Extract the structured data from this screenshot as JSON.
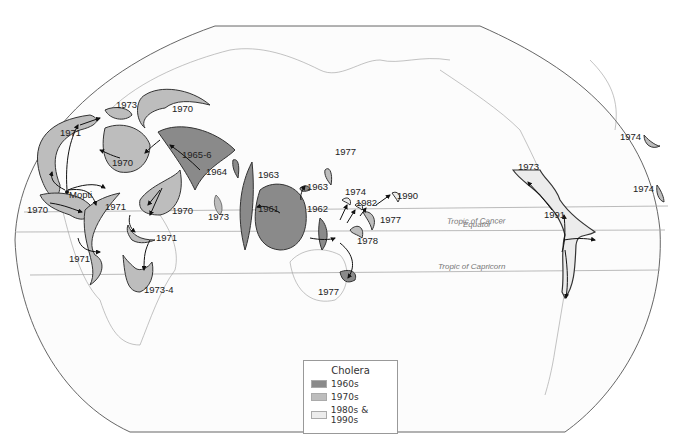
{
  "map": {
    "title": "Cholera",
    "lines": {
      "tropic_cancer": "Tropic of Cancer",
      "equator": "Equator",
      "tropic_capricorn": "Tropic of Capricorn"
    },
    "places": {
      "mopti": "Mopti"
    },
    "labels": {
      "w1973": "1973",
      "w1970a": "1970",
      "w1971a": "1971",
      "w1970b": "1970",
      "w1965": "1965-6",
      "w1964": "1964",
      "w1970c": "1970",
      "w1971b": "1971",
      "w1970d": "1970",
      "w1973b": "1973",
      "w1971c": "1971",
      "w1971d": "1971",
      "w1973_4": "1973-4",
      "e1963a": "1963",
      "e1961": "1961",
      "e1963b": "1963",
      "e1977a": "1977",
      "e1962": "1962",
      "e1974": "1974",
      "e1982": "1982",
      "e1990": "1990",
      "e1977b": "1977",
      "e1978": "1978",
      "e1977c": "1977",
      "a1973": "1973",
      "a1974a": "1974",
      "a1974b": "1974",
      "a1991": "1991"
    }
  },
  "legend": {
    "title": "Cholera",
    "items": [
      {
        "label": "1960s",
        "color": "#8a8a8a"
      },
      {
        "label": "1970s",
        "color": "#bdbdbd"
      },
      {
        "label": "1980s & 1990s",
        "color": "#ececec"
      }
    ]
  },
  "colors": {
    "c1960s": "#8a8a8a",
    "c1970s": "#bdbdbd",
    "c1980s": "#ececec"
  }
}
